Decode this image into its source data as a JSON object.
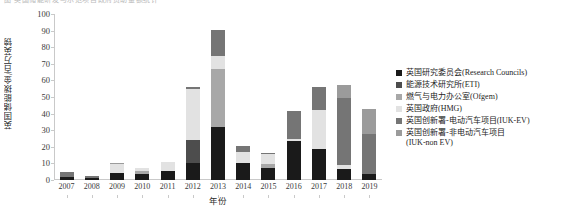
{
  "top_caption": "图 英国储能研发与示范项目政府资助金额统计",
  "chart_data": {
    "type": "bar",
    "stacked": true,
    "title": "",
    "xlabel": "年份",
    "ylabel": "英国储能拨金/百万英镑",
    "ylim": [
      0,
      100
    ],
    "yticks": [
      0,
      10,
      20,
      30,
      40,
      50,
      60,
      70,
      80,
      90,
      100
    ],
    "grid": false,
    "legend_position": "right",
    "categories": [
      "2007",
      "2008",
      "2009",
      "2010",
      "2011",
      "2012",
      "2013",
      "2014",
      "2015",
      "2016",
      "2017",
      "2018",
      "2019"
    ],
    "series": [
      {
        "name": "英国研究委员会(Research Councils)",
        "short": "Research Councils",
        "color": "#1a1a1a",
        "values": [
          2.0,
          1.2,
          4.5,
          3.6,
          5.2,
          10.2,
          32.0,
          10.4,
          7.4,
          23.6,
          18.6,
          6.6,
          3.4
        ]
      },
      {
        "name": "能源技术研究所(ETI)",
        "short": "ETI",
        "color": "#4d4d4d",
        "values": [
          0.0,
          0.0,
          0.0,
          0.0,
          0.0,
          13.8,
          0.0,
          0.0,
          0.0,
          0.0,
          0.0,
          0.0,
          0.0
        ]
      },
      {
        "name": "燃气与电力办公室(Ofgem)",
        "short": "Ofgem",
        "color": "#a8a8a8",
        "values": [
          0.0,
          0.0,
          0.0,
          1.6,
          0.0,
          0.0,
          35.0,
          0.0,
          2.4,
          0.0,
          0.0,
          0.0,
          0.0
        ]
      },
      {
        "name": "英国政府(HMG)",
        "short": "HMG",
        "color": "#e2e2e2",
        "values": [
          0.0,
          0.0,
          5.2,
          2.1,
          5.4,
          30.8,
          8.0,
          6.6,
          5.8,
          1.4,
          23.4,
          2.4,
          0.0
        ]
      },
      {
        "name": "英国创新署-电动汽车项目(IUK-EV)",
        "short": "IUK-EV",
        "color": "#757575",
        "values": [
          2.6,
          1.2,
          0.0,
          0.0,
          0.0,
          1.4,
          15.6,
          3.6,
          0.4,
          16.8,
          14.2,
          40.6,
          24.6
        ]
      },
      {
        "name": "英国创新署-非电动汽车项目\n(IUK-non EV)",
        "short": "IUK-non EV",
        "color": "#9b9b9b",
        "values": [
          0.0,
          0.0,
          0.4,
          0.0,
          0.0,
          0.0,
          0.0,
          0.0,
          0.0,
          0.0,
          0.0,
          7.8,
          15.0
        ]
      }
    ]
  }
}
